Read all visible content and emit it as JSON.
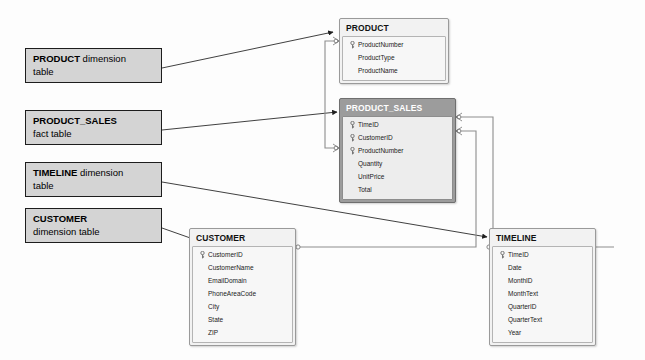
{
  "diagram": {
    "background_color": "#fdfdfd",
    "line_color": "#555555",
    "fact_header_color": "#9c9c9c",
    "dimension_header_color": "#f2f2f2",
    "callout_fill_color": "#d4d4d4"
  },
  "callouts": [
    {
      "name": "product-callout",
      "strong": "PRODUCT",
      "rest": " dimension",
      "line2": "table"
    },
    {
      "name": "product-sales-callout",
      "strong": "PRODUCT_SALES",
      "rest": "",
      "line2": "fact table"
    },
    {
      "name": "timeline-callout",
      "strong": "TIMELINE",
      "rest": " dimension",
      "line2": "table"
    },
    {
      "name": "customer-callout",
      "strong": "CUSTOMER",
      "rest": "",
      "line2": "dimension table"
    }
  ],
  "tables": {
    "product": {
      "name": "PRODUCT",
      "kind": "dimension",
      "fields": [
        {
          "label": "ProductNumber",
          "key": true
        },
        {
          "label": "ProductType",
          "key": false
        },
        {
          "label": "ProductName",
          "key": false
        }
      ]
    },
    "product_sales": {
      "name": "PRODUCT_SALES",
      "kind": "fact",
      "fields": [
        {
          "label": "TimeID",
          "key": true
        },
        {
          "label": "CustomerID",
          "key": true
        },
        {
          "label": "ProductNumber",
          "key": true
        },
        {
          "label": "Quantity",
          "key": false
        },
        {
          "label": "UnitPrice",
          "key": false
        },
        {
          "label": "Total",
          "key": false
        }
      ]
    },
    "customer": {
      "name": "CUSTOMER",
      "kind": "dimension",
      "fields": [
        {
          "label": "CustomerID",
          "key": true
        },
        {
          "label": "CustomerName",
          "key": false
        },
        {
          "label": "EmailDomain",
          "key": false
        },
        {
          "label": "PhoneAreaCode",
          "key": false
        },
        {
          "label": "City",
          "key": false
        },
        {
          "label": "State",
          "key": false
        },
        {
          "label": "ZIP",
          "key": false
        }
      ]
    },
    "timeline": {
      "name": "TIMELINE",
      "kind": "dimension",
      "fields": [
        {
          "label": "TimeID",
          "key": true
        },
        {
          "label": "Date",
          "key": false
        },
        {
          "label": "MonthID",
          "key": false
        },
        {
          "label": "MonthText",
          "key": false
        },
        {
          "label": "QuarterID",
          "key": false
        },
        {
          "label": "QuarterText",
          "key": false
        },
        {
          "label": "Year",
          "key": false
        }
      ]
    }
  },
  "relationships": [
    {
      "name": "product-to-sales",
      "from": "PRODUCT.ProductNumber",
      "to": "PRODUCT_SALES.ProductNumber"
    },
    {
      "name": "timeline-to-sales",
      "from": "TIMELINE.TimeID",
      "to": "PRODUCT_SALES.TimeID"
    },
    {
      "name": "customer-to-sales",
      "from": "CUSTOMER.CustomerID",
      "to": "PRODUCT_SALES.CustomerID"
    }
  ]
}
